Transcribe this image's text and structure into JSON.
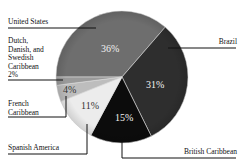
{
  "chart_data": {
    "type": "pie",
    "title": "",
    "slices": [
      {
        "label": "United States",
        "value": 36,
        "display": "36%",
        "color": "#6e6e6e"
      },
      {
        "label": "Brazil",
        "value": 31,
        "display": "31%",
        "color": "#2e2e2e"
      },
      {
        "label": "British Caribbean",
        "value": 15,
        "display": "15%",
        "color": "#0c0c0c"
      },
      {
        "label": "Spanish America",
        "value": 11,
        "display": "11%",
        "color": "#ececec"
      },
      {
        "label": "French Caribbean",
        "value": 4,
        "display": "4%",
        "color": "#bdbdbd"
      },
      {
        "label": "Dutch, Danish, and Swedish Caribbean",
        "value": 2,
        "display": "2%",
        "color": "#9a9a9a"
      }
    ]
  },
  "labels": {
    "us": "United States",
    "brazil": "Brazil",
    "dutch": [
      "Dutch,",
      "Danish, and",
      "Swedish",
      "Caribbean",
      "2%"
    ],
    "french": [
      "French",
      "Caribbean"
    ],
    "spanish": "Spanish America",
    "british": "British Caribbean"
  },
  "values": {
    "us": "36%",
    "brazil": "31%",
    "british": "15%",
    "spanish": "11%",
    "french": "4%"
  }
}
